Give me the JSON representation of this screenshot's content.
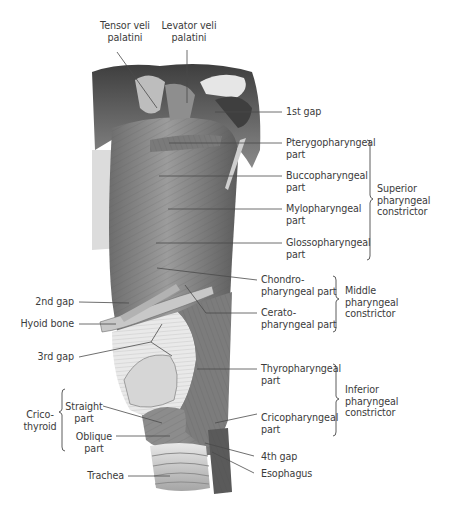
{
  "figure": {
    "top_labels": [
      {
        "id": "tensor",
        "lines": [
          "Tensor veli",
          "palatini"
        ]
      },
      {
        "id": "levator",
        "lines": [
          "Levator veli",
          "palatini"
        ]
      }
    ],
    "right_labels": [
      {
        "id": "gap1",
        "lines": [
          "1st gap"
        ]
      },
      {
        "id": "pterygo",
        "lines": [
          "Pterygopharyngeal",
          "part"
        ]
      },
      {
        "id": "bucco",
        "lines": [
          "Buccopharyngeal",
          "part"
        ]
      },
      {
        "id": "mylo",
        "lines": [
          "Mylopharyngeal",
          "part"
        ]
      },
      {
        "id": "glosso",
        "lines": [
          "Glossopharyngeal",
          "part"
        ]
      },
      {
        "id": "chondro",
        "lines": [
          "Chondro-",
          "pharyngeal part"
        ]
      },
      {
        "id": "cerato",
        "lines": [
          "Cerato-",
          "pharyngeal part"
        ]
      },
      {
        "id": "thyro",
        "lines": [
          "Thyropharyngeal",
          "part"
        ]
      },
      {
        "id": "crico",
        "lines": [
          "Cricopharyngeal",
          "part"
        ]
      },
      {
        "id": "gap4",
        "lines": [
          "4th gap"
        ]
      },
      {
        "id": "esophagus",
        "lines": [
          "Esophagus"
        ]
      }
    ],
    "groups": [
      {
        "id": "superior",
        "lines": [
          "Superior",
          "pharyngeal",
          "constrictor"
        ]
      },
      {
        "id": "middle",
        "lines": [
          "Middle",
          "pharyngeal",
          "constrictor"
        ]
      },
      {
        "id": "inferior",
        "lines": [
          "Inferior",
          "pharyngeal",
          "constrictor"
        ]
      },
      {
        "id": "cricothyroid",
        "lines": [
          "Crico-",
          "thyroid"
        ]
      }
    ],
    "left_labels": [
      {
        "id": "gap2",
        "lines": [
          "2nd gap"
        ]
      },
      {
        "id": "hyoid",
        "lines": [
          "Hyoid bone"
        ]
      },
      {
        "id": "gap3",
        "lines": [
          "3rd gap"
        ]
      },
      {
        "id": "straight",
        "lines": [
          "Straight",
          "part"
        ]
      },
      {
        "id": "oblique",
        "lines": [
          "Oblique",
          "part"
        ]
      },
      {
        "id": "trachea",
        "lines": [
          "Trachea"
        ]
      }
    ]
  }
}
